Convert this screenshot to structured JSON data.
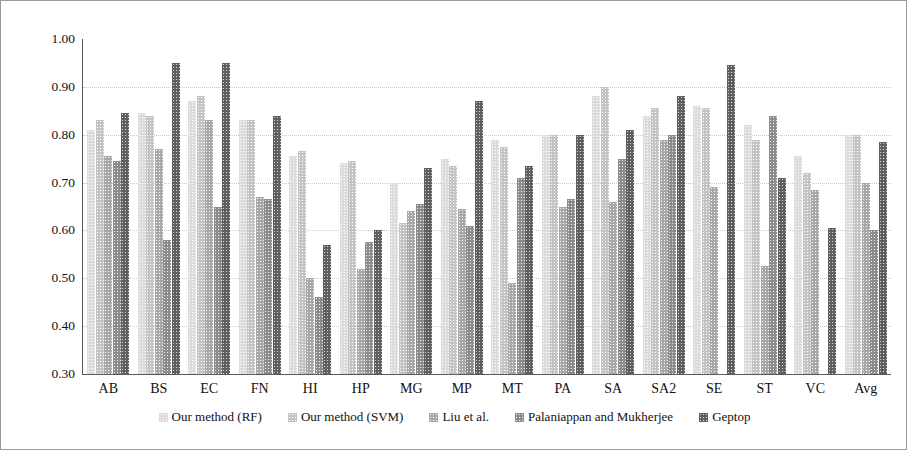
{
  "chart_data": {
    "type": "bar",
    "title": "",
    "xlabel": "",
    "ylabel": "AUC",
    "ylim": [
      0.3,
      1.0
    ],
    "ytick_labels": [
      "1.00",
      "0.90",
      "0.80",
      "0.70",
      "0.60",
      "0.50",
      "0.40",
      "0.30"
    ],
    "ytick_values": [
      1.0,
      0.9,
      0.8,
      0.7,
      0.6,
      0.5,
      0.4,
      0.3
    ],
    "grid": true,
    "legend_position": "bottom",
    "categories": [
      "AB",
      "BS",
      "EC",
      "FN",
      "HI",
      "HP",
      "MG",
      "MP",
      "MT",
      "PA",
      "SA",
      "SA2",
      "SE",
      "ST",
      "VC",
      "Avg"
    ],
    "series": [
      {
        "name": "Our method  (RF)",
        "values": [
          0.81,
          0.845,
          0.87,
          0.83,
          0.755,
          0.74,
          0.7,
          0.75,
          0.79,
          0.8,
          0.88,
          0.84,
          0.86,
          0.82,
          0.755,
          0.8
        ]
      },
      {
        "name": "Our method  (SVM)",
        "values": [
          0.83,
          0.84,
          0.88,
          0.83,
          0.765,
          0.745,
          0.615,
          0.735,
          0.775,
          0.8,
          0.9,
          0.855,
          0.855,
          0.79,
          0.72,
          0.8
        ]
      },
      {
        "name": "Liu et al.",
        "values": [
          0.755,
          0.77,
          0.83,
          0.67,
          0.5,
          0.52,
          0.64,
          0.645,
          0.49,
          0.65,
          0.66,
          0.79,
          0.69,
          0.525,
          0.685,
          0.7
        ]
      },
      {
        "name": "Palaniappan and Mukherjee",
        "values": [
          0.745,
          0.58,
          0.65,
          0.665,
          0.46,
          0.575,
          0.655,
          0.61,
          0.71,
          0.665,
          0.75,
          0.8,
          null,
          0.84,
          null,
          0.6
        ]
      },
      {
        "name": "Geptop",
        "values": [
          0.845,
          0.95,
          0.95,
          0.84,
          0.57,
          0.6,
          0.73,
          0.87,
          0.735,
          0.8,
          0.81,
          0.88,
          0.945,
          0.71,
          0.605,
          0.785
        ]
      }
    ]
  },
  "legend": {
    "items": [
      {
        "label": "Our method  (RF)"
      },
      {
        "label": "Our method  (SVM)"
      },
      {
        "label": "Liu et al."
      },
      {
        "label": "Palaniappan and Mukherjee"
      },
      {
        "label": "Geptop"
      }
    ]
  }
}
